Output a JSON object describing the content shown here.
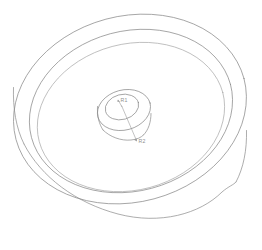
{
  "drawing": {
    "title": "Isometric wireframe of a grooved wheel / pulley disc",
    "object_name": "wheel-pulley-wireframe",
    "view": "isometric",
    "background_color": "#ffffff",
    "line_color": "#8a8a8a",
    "soft_line_color": "#a6a6a6",
    "dimension_color": "#9b9b9b",
    "features": [
      {
        "name": "outer-rim-top-ellipse",
        "label": "Outer rim top face"
      },
      {
        "name": "outer-rim-side-wall",
        "label": "Outer rim cylindrical side"
      },
      {
        "name": "recess-upper-ellipse",
        "label": "Recessed face outer edge"
      },
      {
        "name": "recess-floor-ellipse",
        "label": "Recessed face floor"
      },
      {
        "name": "hub-top-ellipse",
        "label": "Hub top face"
      },
      {
        "name": "hub-side-wall",
        "label": "Hub cylindrical side"
      },
      {
        "name": "hub-bore-ellipse",
        "label": "Central bore"
      }
    ],
    "annotations": [
      {
        "name": "radius-callout-inner",
        "text": "R1",
        "anchor_x": 118,
        "anchor_y": 101,
        "label_x": 120,
        "label_y": 101
      },
      {
        "name": "radius-callout-outer",
        "text": "R2",
        "anchor_x": 122,
        "anchor_y": 104,
        "label_x": 138,
        "label_y": 142
      }
    ]
  }
}
